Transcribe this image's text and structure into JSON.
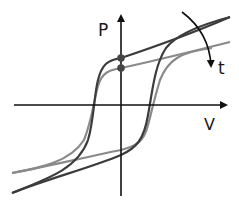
{
  "diagram": {
    "type": "ferroelectric hysteresis loops",
    "labels": {
      "y_axis": "P",
      "x_axis": "V",
      "arrow": "t"
    },
    "colors": {
      "axis": "#111111",
      "loop_dark": "#3c3c3c",
      "loop_light": "#8a8a8a",
      "dot": "#444444"
    },
    "loops": [
      {
        "name": "dark-loop",
        "description": "larger remanent polarization loop"
      },
      {
        "name": "light-loop",
        "description": "smaller remanent polarization loop after time t"
      }
    ],
    "markers": [
      {
        "name": "remanent-dot-upper"
      },
      {
        "name": "remanent-dot-lower"
      }
    ]
  }
}
